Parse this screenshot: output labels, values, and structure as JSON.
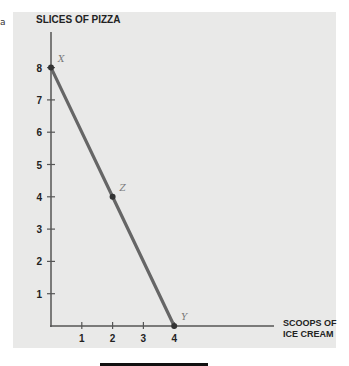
{
  "chart_data": {
    "type": "line",
    "title": "",
    "ylabel": "Slices of pizza",
    "xlabel": "Scoops of ice cream",
    "xlabel_lines": [
      "Scoops of",
      "ice cream"
    ],
    "x_ticks": [
      1,
      2,
      3,
      4
    ],
    "y_ticks": [
      1,
      2,
      3,
      4,
      5,
      6,
      7,
      8
    ],
    "xlim": [
      0,
      7.2
    ],
    "ylim": [
      0,
      9
    ],
    "grid": false,
    "series": [
      {
        "name": "Production possibilities frontier",
        "x": [
          0,
          2,
          4
        ],
        "y": [
          8,
          4,
          0
        ],
        "color": "#666666"
      }
    ],
    "points": [
      {
        "label": "X",
        "x": 0,
        "y": 8
      },
      {
        "label": "Z",
        "x": 2,
        "y": 4
      },
      {
        "label": "Y",
        "x": 4,
        "y": 0
      }
    ]
  },
  "stub_text": "a",
  "colors": {
    "panel": "#e9e9e8",
    "axis": "#555555",
    "line": "#666666",
    "text": "#222222",
    "point_label": "#777777"
  }
}
